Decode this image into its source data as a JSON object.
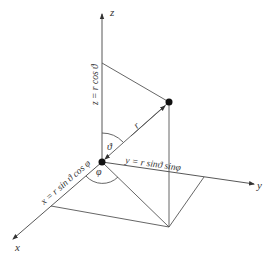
{
  "diagram": {
    "axes": {
      "x": {
        "label": "x"
      },
      "y": {
        "label": "y"
      },
      "z": {
        "label": "z"
      }
    },
    "labels": {
      "radius": "r",
      "polar_angle": "ϑ",
      "azimuth_angle": "φ",
      "z_equation": "z = r cos ϑ",
      "y_equation": "y = r sinϑ  sinφ",
      "x_equation": "x = r sin ϑ cos φ"
    },
    "colors": {
      "line": "#555555",
      "point": "#111111",
      "background": "#ffffff"
    }
  }
}
